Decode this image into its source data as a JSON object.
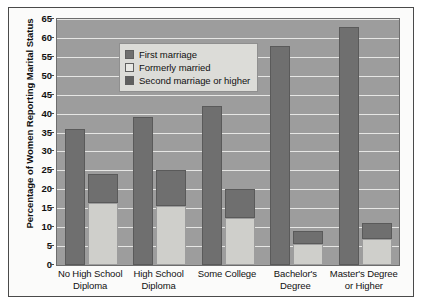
{
  "chart_data": {
    "type": "bar",
    "title": "",
    "subtitle": "",
    "xlabel": "",
    "ylabel": "Percentage of Women Reporting Marital Status",
    "ylim": [
      0,
      65
    ],
    "yticks": [
      0,
      5,
      10,
      15,
      20,
      25,
      30,
      35,
      40,
      45,
      50,
      55,
      60,
      65
    ],
    "grid": true,
    "legend_position": "top-left",
    "categories": [
      "No High School Diploma",
      "High School Diploma",
      "Some College",
      "Bachelor's Degree",
      "Master's Degree or Higher"
    ],
    "category_lines": [
      [
        "No High School",
        "Diploma"
      ],
      [
        "High School",
        "Diploma"
      ],
      [
        "Some College"
      ],
      [
        "Bachelor's",
        "Degree"
      ],
      [
        "Master's Degree",
        "or Higher"
      ]
    ],
    "series": [
      {
        "name": "First marriage",
        "color": "#6f6f6f",
        "values": [
          36,
          39,
          42,
          58,
          63
        ]
      },
      {
        "name": "Formerly married",
        "color": "#cfcfcb",
        "values": [
          16.5,
          15.5,
          12.5,
          5.5,
          7
        ]
      },
      {
        "name": "Second marriage or higher",
        "color": "#6f6f6f",
        "values": [
          24,
          25,
          20,
          9,
          11
        ]
      }
    ]
  },
  "legend": {
    "items": [
      {
        "label": "First marriage",
        "swatch": "#6f6f6f"
      },
      {
        "label": "Formerly married",
        "swatch": "#cfcfcb"
      },
      {
        "label": "Second marriage or higher",
        "swatch": "#6f6f6f"
      }
    ]
  },
  "axis": {
    "y_title": "Percentage of Women Reporting Marital Status"
  }
}
